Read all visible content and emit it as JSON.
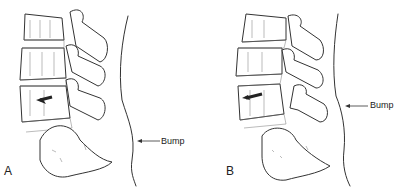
{
  "figure": {
    "panels": [
      {
        "id": "A",
        "label": "A",
        "annotation": "Bump"
      },
      {
        "id": "B",
        "label": "B",
        "annotation": "Bump"
      }
    ],
    "colors": {
      "line": "#333333",
      "background": "#ffffff"
    }
  }
}
